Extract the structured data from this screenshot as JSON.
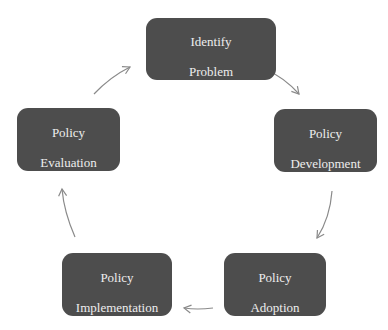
{
  "diagram": {
    "type": "cycle",
    "colors": {
      "node_fill": "#4d4d4d",
      "node_text": "#ededed",
      "arrow": "#8a8a8a",
      "background": "#ffffff"
    },
    "nodes": [
      {
        "id": "identify",
        "line1": "Identify",
        "line2": "Problem"
      },
      {
        "id": "development",
        "line1": "Policy",
        "line2": "Development"
      },
      {
        "id": "adoption",
        "line1": "Policy",
        "line2": "Adoption"
      },
      {
        "id": "implementation",
        "line1": "Policy",
        "line2": "Implementation"
      },
      {
        "id": "evaluation",
        "line1": "Policy",
        "line2": "Evaluation"
      }
    ],
    "edges": [
      {
        "from": "identify",
        "to": "development"
      },
      {
        "from": "development",
        "to": "adoption"
      },
      {
        "from": "adoption",
        "to": "implementation"
      },
      {
        "from": "implementation",
        "to": "evaluation"
      },
      {
        "from": "evaluation",
        "to": "identify"
      }
    ]
  }
}
